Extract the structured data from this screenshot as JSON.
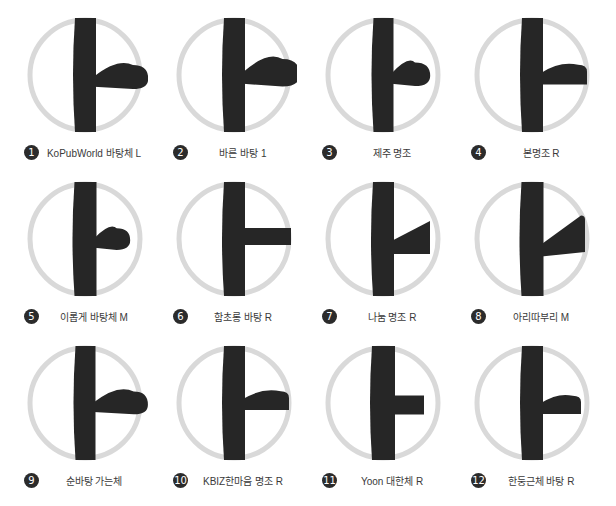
{
  "sheet": {
    "title": "Korean vowel A (ae / ㅏ) typeface specimen grid",
    "glyph": "ㅏ",
    "ring_color": "#d9d9d9",
    "glyph_color": "#262626",
    "badge_color": "#2b2b2b",
    "badge_text_color": "#ffffff",
    "label_color": "#3a3a3a",
    "background": "#ffffff",
    "columns": 4,
    "rows": 3,
    "count": 12
  },
  "specimens": [
    {
      "index": "1",
      "badge": "❶",
      "label": "KoPubWorld 바탕체 L",
      "stem_width": 22,
      "stem_top": 6,
      "stem_bottom": 120,
      "branch_y": 66,
      "branch_thickness": 15,
      "branch_end_x": 122,
      "branch_style": "rounded-swell",
      "branch_rise": 8
    },
    {
      "index": "2",
      "badge": "❷",
      "label": "바른 바탕 1",
      "stem_width": 22,
      "stem_top": 6,
      "stem_bottom": 120,
      "branch_y": 62,
      "branch_thickness": 17,
      "branch_end_x": 124,
      "branch_style": "rounded-swell",
      "branch_rise": 10
    },
    {
      "index": "3",
      "badge": "❸",
      "label": "제주 명조",
      "stem_width": 21,
      "stem_top": 6,
      "stem_bottom": 120,
      "branch_y": 63,
      "branch_thickness": 15,
      "branch_end_x": 106,
      "branch_style": "rounded-swell",
      "branch_rise": 7
    },
    {
      "index": "4",
      "badge": "❹",
      "label": "본명조 R",
      "stem_width": 22,
      "stem_top": 6,
      "stem_bottom": 120,
      "branch_y": 64,
      "branch_thickness": 17,
      "branch_end_x": 118,
      "branch_style": "flat-swell",
      "branch_rise": 6
    },
    {
      "index": "5",
      "badge": "❺",
      "label": "이롭게 바탕체 M",
      "stem_width": 23,
      "stem_top": 6,
      "stem_bottom": 120,
      "branch_y": 64,
      "branch_thickness": 15,
      "branch_end_x": 104,
      "branch_style": "rounded-club",
      "branch_rise": 7
    },
    {
      "index": "6",
      "badge": "❻",
      "label": "함초롱 바탕 R",
      "stem_width": 22,
      "stem_top": 6,
      "stem_bottom": 120,
      "branch_y": 62,
      "branch_thickness": 14,
      "branch_end_x": 120,
      "branch_style": "flat-bar",
      "branch_rise": 3
    },
    {
      "index": "7",
      "badge": "❼",
      "label": "나눔 명조 R",
      "stem_width": 22,
      "stem_top": 6,
      "stem_bottom": 120,
      "branch_y": 68,
      "branch_thickness": 18,
      "branch_end_x": 110,
      "branch_style": "wedge-taper",
      "branch_rise": 12
    },
    {
      "index": "8",
      "badge": "❽",
      "label": "아리따부리 M",
      "stem_width": 23,
      "stem_top": 6,
      "stem_bottom": 120,
      "branch_y": 70,
      "branch_thickness": 17,
      "branch_end_x": 116,
      "branch_style": "wedge-rise",
      "branch_rise": 16
    },
    {
      "index": "9",
      "badge": "❾",
      "label": "순바탕 가는체",
      "stem_width": 21,
      "stem_top": 6,
      "stem_bottom": 120,
      "branch_y": 64,
      "branch_thickness": 14,
      "branch_end_x": 122,
      "branch_style": "rounded-swell",
      "branch_rise": 9
    },
    {
      "index": "10",
      "badge": "❿",
      "label": "KBIZ한마음 명조 R",
      "stem_width": 22,
      "stem_top": 6,
      "stem_bottom": 120,
      "branch_y": 62,
      "branch_thickness": 16,
      "branch_end_x": 118,
      "branch_style": "flat-swell",
      "branch_rise": 6
    },
    {
      "index": "11",
      "badge": "⓫",
      "label": "Yoon 대한체 R",
      "stem_width": 24,
      "stem_top": 6,
      "stem_bottom": 120,
      "branch_y": 66,
      "branch_thickness": 17,
      "branch_end_x": 104,
      "branch_style": "flat-bar",
      "branch_rise": 2
    },
    {
      "index": "12",
      "badge": "⓬",
      "label": "한둥근체 바탕 R",
      "stem_width": 22,
      "stem_top": 6,
      "stem_bottom": 120,
      "branch_y": 66,
      "branch_thickness": 16,
      "branch_end_x": 112,
      "branch_style": "flat-swell",
      "branch_rise": 5
    }
  ]
}
